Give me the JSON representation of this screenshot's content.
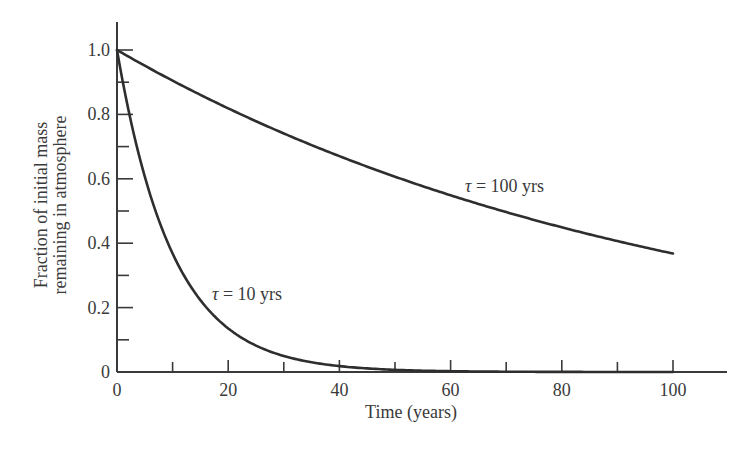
{
  "chart_data": {
    "type": "line",
    "title": "",
    "xlabel": "Time (years)",
    "ylabel_lines": [
      "Fraction of initial mass",
      "remaining in atmosphere"
    ],
    "ylabel": "Fraction of initial mass remaining in atmosphere",
    "xlim": [
      0,
      110
    ],
    "ylim": [
      0,
      1.1
    ],
    "x_ticks_major": [
      0,
      20,
      40,
      60,
      80,
      100
    ],
    "x_ticks_minor": [
      10,
      30,
      50,
      70,
      90
    ],
    "x_tick_labels": [
      "0",
      "20",
      "40",
      "60",
      "80",
      "100"
    ],
    "y_ticks_major": [
      0,
      0.2,
      0.4,
      0.6,
      0.8,
      1.0
    ],
    "y_ticks_minor": [
      0.1,
      0.3,
      0.5,
      0.7,
      0.9
    ],
    "y_tick_labels": [
      "0",
      "0.2",
      "0.4",
      "0.6",
      "0.8",
      "1.0"
    ],
    "grid": false,
    "legend": "inline labels",
    "series": [
      {
        "name": "τ = 100 yrs",
        "tau": 100,
        "label_prefix": "τ",
        "label_suffix": " = 100 yrs",
        "x": [
          0,
          10,
          20,
          30,
          40,
          50,
          60,
          70,
          80,
          90,
          100
        ],
        "values": [
          1.0,
          0.905,
          0.819,
          0.741,
          0.67,
          0.607,
          0.549,
          0.497,
          0.449,
          0.407,
          0.368
        ]
      },
      {
        "name": "τ = 10 yrs",
        "tau": 10,
        "label_prefix": "τ",
        "label_suffix": " = 10 yrs",
        "x": [
          0,
          10,
          20,
          30,
          40,
          50,
          60,
          70,
          80,
          90,
          100
        ],
        "values": [
          1.0,
          0.368,
          0.135,
          0.05,
          0.018,
          0.007,
          0.002,
          0.001,
          0.0003,
          0.0001,
          5e-05
        ]
      }
    ],
    "colors": {
      "axis": "#3a3a3a",
      "curve": "#2e2e2e",
      "background": "#ffffff"
    }
  }
}
